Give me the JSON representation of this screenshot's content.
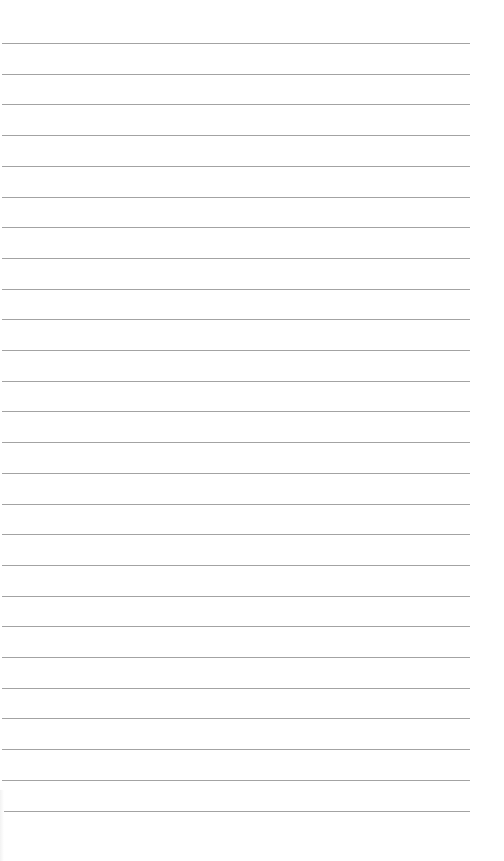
{
  "document": {
    "type": "lined-paper",
    "ruled_lines": {
      "count": 26,
      "first_y": 43,
      "spacing": 30.7,
      "left": 2,
      "right": 470,
      "color": "#a3a3a3"
    },
    "content": ""
  }
}
